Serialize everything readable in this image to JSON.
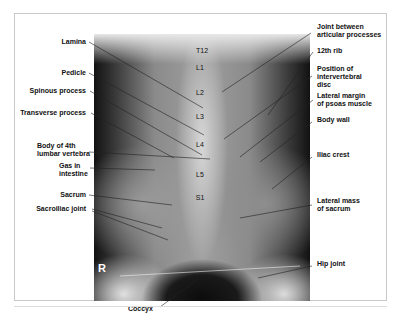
{
  "figure": {
    "type": "AP radiograph of lumbar spine",
    "side_marker": "R",
    "vertebra_labels": [
      "T12",
      "L1",
      "L2",
      "L3",
      "L4",
      "L5",
      "S1"
    ],
    "left_labels": [
      {
        "text": "Lamina"
      },
      {
        "text": "Pedicle"
      },
      {
        "text": "Spinous process"
      },
      {
        "text": "Transverse process"
      },
      {
        "text": "Body of 4th\nlumbar vertebra"
      },
      {
        "text": "Gas in\nintestine"
      },
      {
        "text": "Sacrum"
      },
      {
        "text": "Sacroiliac joint"
      }
    ],
    "right_labels": [
      {
        "text": "Joint between\narticular processes"
      },
      {
        "text": "12th rib"
      },
      {
        "text": "Position of\nintervertebral\ndisc"
      },
      {
        "text": "Lateral margin\nof psoas muscle"
      },
      {
        "text": "Body wall"
      },
      {
        "text": "Iliac crest"
      },
      {
        "text": "Lateral mass\nof sacrum"
      },
      {
        "text": "Hip joint"
      }
    ],
    "bottom_labels": [
      {
        "text": "Coccyx"
      }
    ]
  }
}
